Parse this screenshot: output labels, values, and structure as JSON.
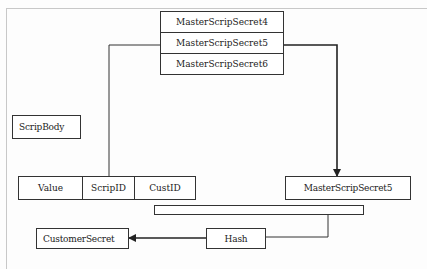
{
  "diagram": {
    "master_secrets": [
      {
        "label": "MasterScripSecret4"
      },
      {
        "label": "MasterScripSecret5"
      },
      {
        "label": "MasterScripSecret6"
      }
    ],
    "scrip_body": {
      "label": "ScripBody"
    },
    "scrip_fields": [
      {
        "label": "Value"
      },
      {
        "label": "ScripID"
      },
      {
        "label": "CustID"
      }
    ],
    "selected_secret": {
      "label": "MasterScripSecret5"
    },
    "concatenation_bar": {
      "label": ""
    },
    "hash": {
      "label": "Hash"
    },
    "customer_secret": {
      "label": "CustomerSecret"
    },
    "colors": {
      "line": "#333333",
      "frame": "#c8c8c8",
      "background": "#fdfdfd"
    }
  }
}
